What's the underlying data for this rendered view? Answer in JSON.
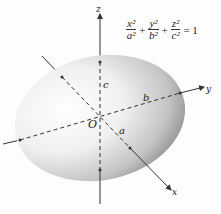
{
  "figure": {
    "type": "ellipsoid-diagram",
    "equation": {
      "terms": [
        {
          "num": "x²",
          "den": "a²"
        },
        {
          "num": "y²",
          "den": "b²"
        },
        {
          "num": "z²",
          "den": "c²"
        }
      ],
      "plus": "+",
      "equals": "= 1"
    },
    "axes": {
      "x_label": "x",
      "y_label": "y",
      "z_label": "z"
    },
    "semi_axes": {
      "a_label": "a",
      "b_label": "b",
      "c_label": "c"
    },
    "origin_label": "O",
    "colors": {
      "axis": "#333333",
      "surface_light": "#ffffff",
      "surface_dark": "#8a8a8a"
    }
  }
}
